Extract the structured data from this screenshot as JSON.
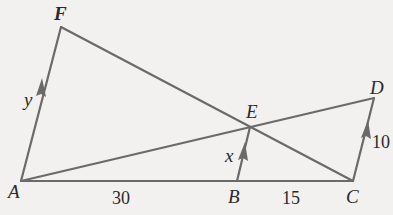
{
  "diagram": {
    "type": "geometry",
    "points": {
      "A": {
        "label": "A",
        "x": 21,
        "y": 181
      },
      "F": {
        "label": "F",
        "x": 61,
        "y": 27
      },
      "E": {
        "label": "E",
        "x": 250,
        "y": 127
      },
      "B": {
        "label": "B",
        "x": 237,
        "y": 181
      },
      "C": {
        "label": "C",
        "x": 353,
        "y": 181
      },
      "D": {
        "label": "D",
        "x": 374,
        "y": 98
      }
    },
    "segments": [
      "AF",
      "FC",
      "AD",
      "AC",
      "BE",
      "CD"
    ],
    "parallel_marks": [
      "AF",
      "BE",
      "CD"
    ],
    "measures": {
      "AF": "y",
      "BE": "x",
      "CD": "10",
      "AB": "30",
      "BC": "15"
    },
    "colors": {
      "line": "#6a6a6a",
      "text": "#2a2a2a",
      "background": "#f2f1ef"
    }
  }
}
